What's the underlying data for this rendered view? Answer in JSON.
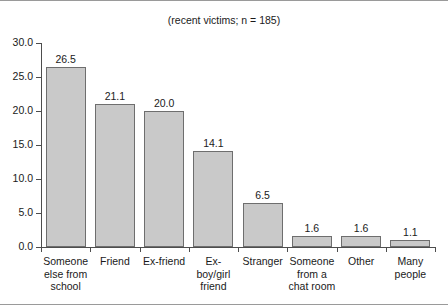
{
  "chart_data": {
    "type": "bar",
    "title": "(recent victims; n = 185)",
    "xlabel": "",
    "ylabel": "",
    "ylim": [
      0,
      30
    ],
    "yticks": [
      "0.0",
      "5.0",
      "10.0",
      "15.0",
      "20.0",
      "25.0",
      "30.0"
    ],
    "grid": false,
    "legend": false,
    "bar_fill_color": "#c9c9c9",
    "bar_edge_color": "#6e6e6e",
    "axis_color": "#4d4d4d",
    "categories": [
      "Someone else from school",
      "Friend",
      "Ex-friend",
      "Ex-boy/girl friend",
      "Stranger",
      "Someone from a chat room",
      "Other",
      "Many people"
    ],
    "category_lines": [
      [
        "Someone",
        "else from",
        "school"
      ],
      [
        "Friend"
      ],
      [
        "Ex-friend"
      ],
      [
        "Ex-boy/girl",
        "friend"
      ],
      [
        "Stranger"
      ],
      [
        "Someone",
        "from a",
        "chat room"
      ],
      [
        "Other"
      ],
      [
        "Many",
        "people"
      ]
    ],
    "values": [
      26.5,
      21.1,
      20.0,
      14.1,
      6.5,
      1.6,
      1.6,
      1.1
    ],
    "value_labels": [
      "26.5",
      "21.1",
      "20.0",
      "14.1",
      "6.5",
      "1.6",
      "1.6",
      "1.1"
    ]
  }
}
